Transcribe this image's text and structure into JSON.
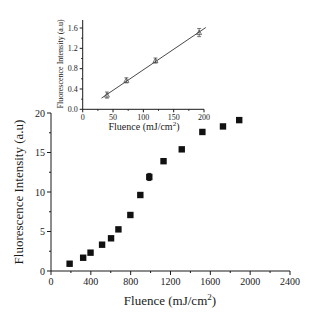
{
  "chart_data": [
    {
      "id": "main",
      "type": "scatter",
      "title": "",
      "xlabel": "Fluence (mJ/cm",
      "xlabel_sup": "2",
      "xlabel_end": ")",
      "ylabel": "Fluorescence Intensity (a.u)",
      "xlim": [
        0,
        2400
      ],
      "ylim": [
        0,
        20
      ],
      "xticks": [
        0,
        400,
        800,
        1200,
        1600,
        2000,
        2400
      ],
      "yticks": [
        0,
        5,
        10,
        15,
        20
      ],
      "grid": false,
      "marker": "filled-square",
      "series": [
        {
          "name": "Fluorescence",
          "x": [
            187,
            323,
            397,
            513,
            603,
            677,
            797,
            897,
            987,
            1130,
            1313,
            1520,
            1727,
            1890
          ],
          "y": [
            0.92,
            1.68,
            2.32,
            3.33,
            4.14,
            5.27,
            7.09,
            9.62,
            11.9,
            13.9,
            15.4,
            17.6,
            18.3,
            19.1
          ],
          "yerr": [
            0.1,
            0.1,
            0.1,
            0.1,
            0.1,
            0.1,
            0.1,
            0.1,
            0.45,
            0.1,
            0.1,
            0.1,
            0.1,
            0.1
          ]
        }
      ]
    },
    {
      "id": "inset",
      "type": "scatter",
      "title": "",
      "xlabel": "Fluence (mJ/cm",
      "xlabel_sup": "2",
      "xlabel_end": ")",
      "ylabel": "Fluorescence Intensity (a.u)",
      "xlim": [
        0,
        200
      ],
      "ylim": [
        0,
        1.7
      ],
      "xticks": [
        0,
        50,
        100,
        150,
        200
      ],
      "yticks": [
        0.0,
        0.4,
        0.8,
        1.2,
        1.6
      ],
      "ytick_labels": [
        "0.0",
        "0.4",
        "0.8",
        "1.2",
        "1.6"
      ],
      "grid": false,
      "marker": "open-triangle",
      "series": [
        {
          "name": "Low fluence",
          "x": [
            40,
            72,
            120,
            192
          ],
          "y": [
            0.28,
            0.57,
            0.96,
            1.51
          ],
          "yerr": [
            0.06,
            0.05,
            0.05,
            0.08
          ]
        }
      ],
      "fit_line": {
        "x": [
          31,
          203
        ],
        "y": [
          0.22,
          1.61
        ]
      }
    }
  ]
}
